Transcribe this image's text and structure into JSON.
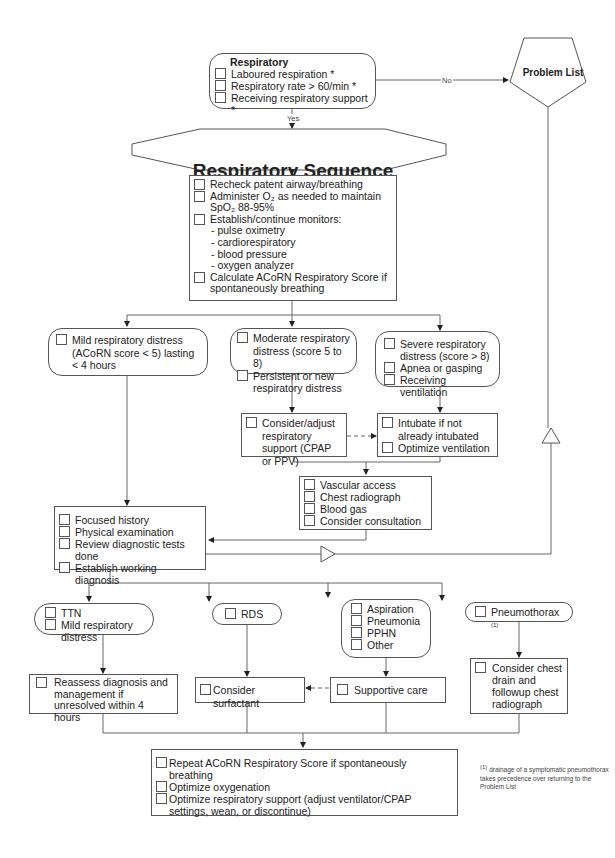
{
  "diagram": {
    "title": "Respiratory Sequence",
    "problem_list": {
      "label": "Problem List"
    },
    "respiratory_box": {
      "heading": "Respiratory",
      "items": [
        "Laboured respiration *",
        "Respiratory rate > 60/min *",
        "Receiving respiratory support *"
      ]
    },
    "edge_labels": {
      "yes": "Yes",
      "no": "No"
    },
    "initial_actions": {
      "items": [
        {
          "text": "Recheck patent airway/breathing"
        },
        {
          "text": "Administer O₂ as needed to maintain SpO₂ 88-95%"
        },
        {
          "text": "Establish/continue monitors:",
          "sub": [
            "- pulse oximetry",
            "- cardiorespiratory",
            "- blood pressure",
            "- oxygen analyzer"
          ]
        },
        {
          "text": "Calculate ACoRN Respiratory Score if spontaneously breathing"
        }
      ]
    },
    "severity": {
      "mild": [
        "Mild respiratory distress (ACoRN score < 5) lasting  <  4 hours"
      ],
      "moderate": [
        "Moderate respiratory distress (score 5 to 8)",
        "Persistent or new respiratory distress"
      ],
      "severe": [
        "Severe respiratory distress (score > 8)",
        "Apnea  or gasping",
        "Receiving ventilation"
      ]
    },
    "support": {
      "adjust": [
        "Consider/adjust respiratory support (CPAP or PPV)"
      ],
      "intubate": [
        "Intubate if not already intubated",
        "Optimize ventilation"
      ]
    },
    "investigations": [
      "Vascular access",
      "Chest radiograph",
      "Blood gas",
      "Consider consultation"
    ],
    "diagnosis_steps": [
      "Focused history",
      "Physical examination",
      "Review diagnostic tests done",
      "Establish working diagnosis"
    ],
    "diagnoses": {
      "ttn": [
        "TTN",
        "Mild respiratory distress"
      ],
      "rds": [
        "RDS"
      ],
      "other": [
        "Aspiration",
        "Pneumonia",
        "PPHN",
        "Other"
      ],
      "pneumothorax": {
        "label": "Pneumothorax",
        "footnote_mark": "(1)"
      }
    },
    "management": {
      "reassess": [
        "Reassess diagnosis and management if unresolved within 4 hours"
      ],
      "surfactant": [
        "Consider surfactant"
      ],
      "supportive": [
        "Supportive care"
      ],
      "chest_drain": [
        "Consider chest drain and followup chest radiograph"
      ]
    },
    "final_actions": [
      "Repeat ACoRN Respiratory Score if spontaneously breathing",
      "Optimize oxygenation",
      "Optimize respiratory support (adjust ventilator/CPAP settings, wean, or discontinue)"
    ],
    "footnote": {
      "mark": "(1)",
      "text": "drainage of a symptomatic pneumothorax takes precedence over returning to the Problem List"
    }
  }
}
